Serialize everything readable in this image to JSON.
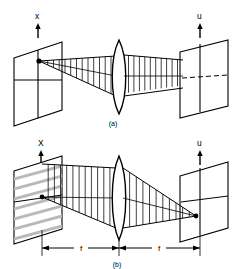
{
  "figure": {
    "background": "#ffffff",
    "ink": "#000000",
    "grating_color": "#b9b9b9",
    "panels": [
      {
        "id": "a",
        "caption": "(a)",
        "input_axis_label": "x",
        "output_axis_label": "u",
        "input_arrow": "up-arrow-icon",
        "output_arrow": "up-arrow-icon",
        "lens_label": "biconvex-lens",
        "axis_style": "dashed-right-half",
        "description_source": "point-source",
        "description_target": "plane-wave"
      },
      {
        "id": "b",
        "caption": "(b)",
        "input_axis_label": "X",
        "output_axis_label": "u",
        "input_arrow": "up-arrow-icon",
        "output_arrow": "up-arrow-icon",
        "lens_label": "biconvex-lens",
        "axis_style": "solid",
        "description_source": "grating-plane",
        "description_target": "focal-point",
        "dimensions": [
          {
            "label": "f",
            "segment": "object-to-lens"
          },
          {
            "label": "f",
            "segment": "lens-to-image"
          }
        ]
      }
    ]
  }
}
